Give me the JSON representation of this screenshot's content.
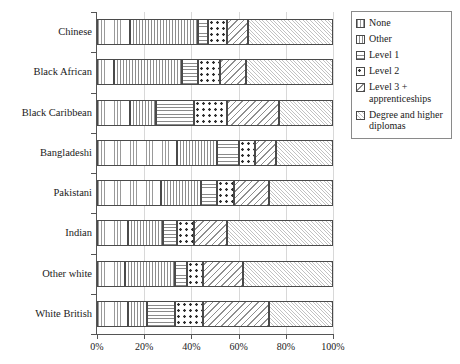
{
  "chart_data": {
    "type": "bar",
    "orientation": "horizontal",
    "stacked": true,
    "normalized": true,
    "title": "",
    "subtitle": "",
    "xlabel": "",
    "ylabel": "",
    "xlim": [
      0,
      100
    ],
    "xticks": [
      0,
      20,
      40,
      60,
      80,
      100
    ],
    "xticklabels": [
      "0%",
      "20%",
      "40%",
      "60%",
      "80%",
      "100%"
    ],
    "grid": true,
    "grid_axis": "x",
    "legend_position": "top-right",
    "categories": [
      "Chinese",
      "Black African",
      "Black Caribbean",
      "Bangladeshi",
      "Pakistani",
      "Indian",
      "Other white",
      "White British"
    ],
    "series": [
      {
        "name": "None",
        "pattern": "vertical-lines",
        "values": [
          14,
          7,
          14,
          34,
          27,
          13,
          12,
          13
        ]
      },
      {
        "name": "Other",
        "pattern": "fine-dot-grid",
        "values": [
          29,
          29,
          11,
          17,
          17,
          15,
          21,
          8
        ]
      },
      {
        "name": "Level 1",
        "pattern": "horizontal-lines",
        "values": [
          4,
          7,
          16,
          9,
          7,
          6,
          5,
          12
        ]
      },
      {
        "name": "Level 2",
        "pattern": "large-dots",
        "values": [
          8,
          9,
          14,
          7,
          7,
          7,
          7,
          12
        ]
      },
      {
        "name": "Level 3 + apprenticeships",
        "pattern": "diagonal-stripes",
        "values": [
          9,
          11,
          22,
          9,
          15,
          14,
          17,
          28
        ]
      },
      {
        "name": "Degree and higher diplomas",
        "pattern": "fine-crosshatch",
        "values": [
          36,
          37,
          23,
          24,
          27,
          45,
          38,
          27
        ]
      }
    ]
  },
  "legend": {
    "items": [
      {
        "label": "None"
      },
      {
        "label": "Other"
      },
      {
        "label": "Level 1"
      },
      {
        "label": "Level 2"
      },
      {
        "label": "Level 3 + apprenticeships"
      },
      {
        "label": "Degree and higher diplomas"
      }
    ]
  }
}
